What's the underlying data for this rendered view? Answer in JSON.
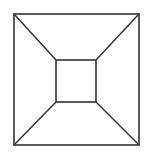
{
  "diagram": {
    "stroke_color": "#333333",
    "background": "#ffffff",
    "outer_square": {
      "x1": 14,
      "y1": 14,
      "x2": 139,
      "y2": 145
    },
    "inner_square": {
      "x1": 56,
      "y1": 60,
      "x2": 96,
      "y2": 102
    }
  }
}
